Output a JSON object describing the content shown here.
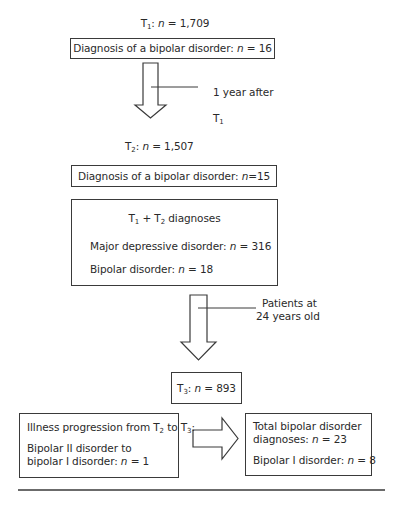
{
  "stages": {
    "t1": {
      "label_prefix": "T",
      "label_sub": "1",
      "label_sep": ": ",
      "n_var": "n",
      "n_text": " = 1,709"
    },
    "t1_box": {
      "text": "Diagnosis of a bipolar disorder: ",
      "n_var": "n",
      "n_text": " = 16"
    },
    "arrow1_note": {
      "line1": "1 year after",
      "line2_prefix": "T",
      "line2_sub": "1"
    },
    "t2": {
      "label_prefix": "T",
      "label_sub": "2",
      "label_sep": ": ",
      "n_var": "n",
      "n_text": " = 1,507"
    },
    "t2_box": {
      "text": "Diagnosis of a bipolar disorder: ",
      "n_var": "n",
      "n_text": "=15"
    },
    "combined_box": {
      "title_a": "T",
      "title_a_sub": "1",
      "title_plus": " + T",
      "title_b_sub": "2",
      "title_rest": " diagnoses",
      "mdd_text": "Major depressive disorder: ",
      "mdd_var": "n",
      "mdd_n": " = 316",
      "bd_text": "Bipolar disorder: ",
      "bd_var": "n",
      "bd_n": " = 18"
    },
    "arrow2_note": {
      "line1": "Patients at",
      "line2": "24 years old"
    },
    "t3_box": {
      "label_prefix": "T",
      "label_sub": "3",
      "label_sep": ": ",
      "n_var": "n",
      "n_text": " = 893"
    },
    "progression_box": {
      "title_a": "Illness progression from T",
      "title_a_sub": "2",
      "title_mid": " to T",
      "title_b_sub": "3",
      "title_end": ":",
      "line1": "Bipolar II disorder to",
      "line2": "bipolar I disorder: ",
      "n_var": "n",
      "n_text": " = 1"
    },
    "total_box": {
      "line1": "Total bipolar disorder",
      "line2": "diagnoses: ",
      "var2": "n",
      "n2": " = 23",
      "line3": "Bipolar I disorder: ",
      "var3": "n",
      "n3": " = 8"
    }
  },
  "colors": {
    "stroke": "#3a3a3a",
    "text": "#2a2a2a",
    "background": "#ffffff"
  }
}
